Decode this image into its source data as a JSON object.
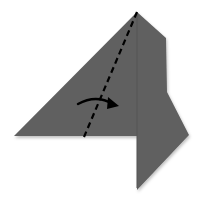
{
  "diagram": {
    "type": "origami-step",
    "colors": {
      "background": "#ffffff",
      "paper": "#616161",
      "paper_shadow": "#4a4a4a",
      "crease": "#555555",
      "fold_line": "#000000",
      "arrow": "#000000"
    },
    "shapes": {
      "paper_outline": "137,12 166,38 167,92 189,135 137,190 137,136 14,136",
      "crease_line": {
        "x1": 137,
        "y1": 14,
        "x2": 137,
        "y2": 188
      },
      "valley_fold_line": {
        "x1": 137,
        "y1": 12,
        "x2": 84,
        "y2": 137
      },
      "fold_arrow": {
        "path": "M78,104 Q96,94 114,104",
        "head": "110,97 118,106 108,108"
      }
    },
    "labels": {
      "fold_line": "valley-fold",
      "arrow": "fold-direction-right"
    }
  }
}
